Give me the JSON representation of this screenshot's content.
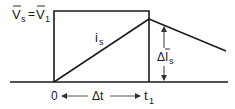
{
  "diagram": {
    "voltage_label": {
      "lhs": "V",
      "lhs_sub": "s",
      "eq": "=",
      "rhs": "V",
      "rhs_sub": "1"
    },
    "current_label": {
      "main": "i",
      "sub": "s"
    },
    "delta_current_label": {
      "prefix": "Δ",
      "main": "I",
      "sub": "s"
    },
    "time_origin": "0",
    "time_interval": "Δt",
    "time_end": {
      "main": "t",
      "sub": "1"
    },
    "colors": {
      "line": "#1a1a1a",
      "arrow": "#555555",
      "background": "#ffffff"
    }
  }
}
